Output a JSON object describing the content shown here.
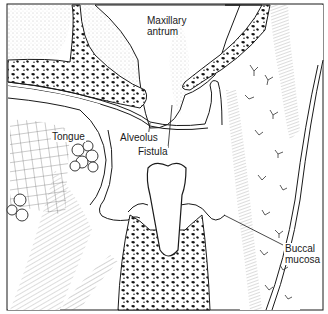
{
  "figure": {
    "type": "anatomical-cross-section",
    "colors": {
      "ink": "#1a1a1a",
      "stipple": "#9a9a9a",
      "paper": "#ffffff"
    }
  },
  "labels": {
    "maxillary_antrum": {
      "line1": "Maxillary",
      "line2": "antrum"
    },
    "tongue": "Tongue",
    "alveolus": "Alveolus",
    "fistula": "Fistula",
    "buccal_mucosa": {
      "line1": "Buccal",
      "line2": "mucosa"
    }
  }
}
